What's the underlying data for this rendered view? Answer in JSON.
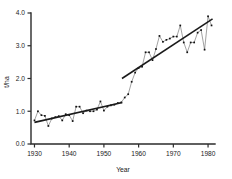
{
  "chart_data": {
    "type": "line",
    "title": "",
    "subtitle": "",
    "xlabel": "Year",
    "ylabel": "t/ha",
    "xlim": [
      1929,
      1982
    ],
    "ylim": [
      0.0,
      4.0
    ],
    "grid": false,
    "legend_position": "none",
    "x_tick_labels": [
      "1930",
      "1940",
      "1950",
      "1960",
      "1970",
      "1980"
    ],
    "x_ticks": [
      1930,
      1940,
      1950,
      1960,
      1970,
      1980
    ],
    "y_tick_labels": [
      "0.0",
      "1.0",
      "2.0",
      "3.0",
      "4.0"
    ],
    "y_ticks": [
      0.0,
      1.0,
      2.0,
      3.0,
      4.0
    ],
    "marker_style": "filled-square",
    "series": [
      {
        "name": "Annual yield",
        "style": "line-with-markers",
        "x": [
          1930,
          1931,
          1932,
          1933,
          1934,
          1935,
          1936,
          1937,
          1938,
          1939,
          1940,
          1941,
          1942,
          1943,
          1944,
          1945,
          1946,
          1947,
          1948,
          1949,
          1950,
          1951,
          1952,
          1953,
          1954,
          1955,
          1956,
          1957,
          1958,
          1959,
          1960,
          1961,
          1962,
          1963,
          1964,
          1965,
          1966,
          1967,
          1968,
          1969,
          1970,
          1971,
          1972,
          1973,
          1974,
          1975,
          1976,
          1977,
          1978,
          1979,
          1980,
          1981
        ],
        "values": [
          0.72,
          1.0,
          0.88,
          0.86,
          0.55,
          0.78,
          0.82,
          0.85,
          0.72,
          0.91,
          0.88,
          0.7,
          1.14,
          1.14,
          0.94,
          1.02,
          1.0,
          1.0,
          1.05,
          1.3,
          1.02,
          1.14,
          1.18,
          1.2,
          1.25,
          1.27,
          1.42,
          1.52,
          1.9,
          2.18,
          2.32,
          2.36,
          2.8,
          2.8,
          2.56,
          2.9,
          3.3,
          3.12,
          3.18,
          3.22,
          3.28,
          3.28,
          3.62,
          3.1,
          2.8,
          3.1,
          3.1,
          3.4,
          3.48,
          2.88,
          3.9,
          3.62
        ]
      },
      {
        "name": "Trend 1930-1955",
        "style": "thick-regression-line",
        "x": [
          1930,
          1955.3
        ],
        "values": [
          0.66,
          1.27
        ]
      },
      {
        "name": "Trend 1955-1981",
        "style": "thick-regression-line",
        "x": [
          1955.2,
          1981.3
        ],
        "values": [
          2.0,
          3.82
        ]
      }
    ]
  }
}
